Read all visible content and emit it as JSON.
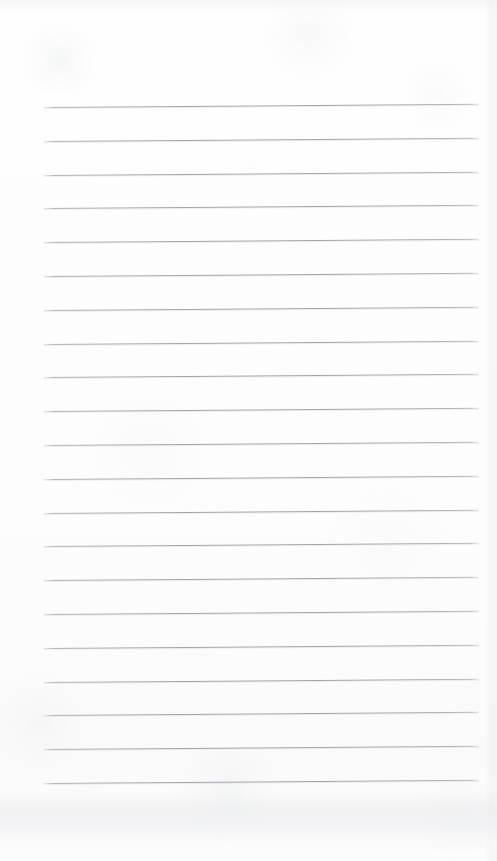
{
  "page": {
    "kind": "blank-lined-notebook-page",
    "width_px": 497,
    "height_px": 861,
    "paper_color": "#fdfdfd",
    "rule_color": "#a3a7ad",
    "content_text": "",
    "has_handwriting": false,
    "has_printed_text": false
  },
  "ruling": {
    "line_count": 21,
    "first_line_y_px": 107,
    "line_spacing_px": 33.8,
    "line_start_x_px": 44,
    "line_end_x_px": 479,
    "line_thickness_px": 1,
    "tilt_deg": -0.42,
    "top_margin_px": 107,
    "bottom_margin_px": 78,
    "left_margin_px": 44,
    "right_margin_px": 18
  }
}
